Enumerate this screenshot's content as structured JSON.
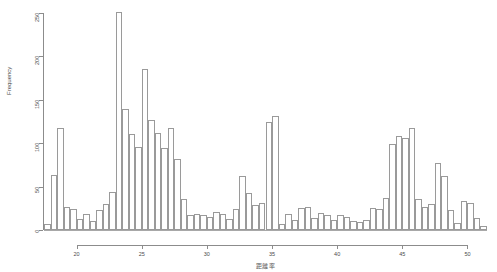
{
  "chart_data": {
    "type": "bar",
    "chart_subtype": "histogram",
    "title": "",
    "subtitle": "",
    "xlabel": "距離率",
    "ylabel": "Frequency",
    "xlim": [
      17.5,
      51.5
    ],
    "ylim": [
      0,
      250
    ],
    "xticks": [
      20,
      25,
      30,
      35,
      40,
      45,
      50
    ],
    "yticks": [
      0,
      50,
      100,
      150,
      200,
      250
    ],
    "grid": false,
    "legend": null,
    "bin_width": 0.5,
    "bar_style": {
      "fill": "none",
      "edge_color": "#9a9a9a"
    },
    "bin_starts": [
      17.5,
      18.0,
      18.5,
      19.0,
      19.5,
      20.0,
      20.5,
      21.0,
      21.5,
      22.0,
      22.5,
      23.0,
      23.5,
      24.0,
      24.5,
      25.0,
      25.5,
      26.0,
      26.5,
      27.0,
      27.5,
      28.0,
      28.5,
      29.0,
      29.5,
      30.0,
      30.5,
      31.0,
      31.5,
      32.0,
      32.5,
      33.0,
      33.5,
      34.0,
      34.5,
      35.0,
      35.5,
      36.0,
      36.5,
      37.0,
      37.5,
      38.0,
      38.5,
      39.0,
      39.5,
      40.0,
      40.5,
      41.0,
      41.5,
      42.0,
      42.5,
      43.0,
      43.5,
      44.0,
      44.5,
      45.0,
      45.5,
      46.0,
      46.5,
      47.0,
      47.5,
      48.0,
      48.5,
      49.0,
      49.5,
      50.0,
      50.5,
      51.0
    ],
    "values": [
      7,
      63,
      118,
      26,
      24,
      13,
      19,
      10,
      23,
      30,
      44,
      251,
      139,
      111,
      96,
      186,
      127,
      112,
      95,
      118,
      82,
      36,
      17,
      19,
      17,
      15,
      21,
      18,
      13,
      24,
      62,
      43,
      29,
      31,
      125,
      131,
      7,
      19,
      12,
      25,
      26,
      14,
      20,
      17,
      11,
      17,
      15,
      10,
      9,
      12,
      25,
      24,
      37,
      99,
      108,
      106,
      118,
      36,
      27,
      30,
      77,
      62,
      23,
      8,
      33,
      31,
      14,
      5
    ]
  }
}
